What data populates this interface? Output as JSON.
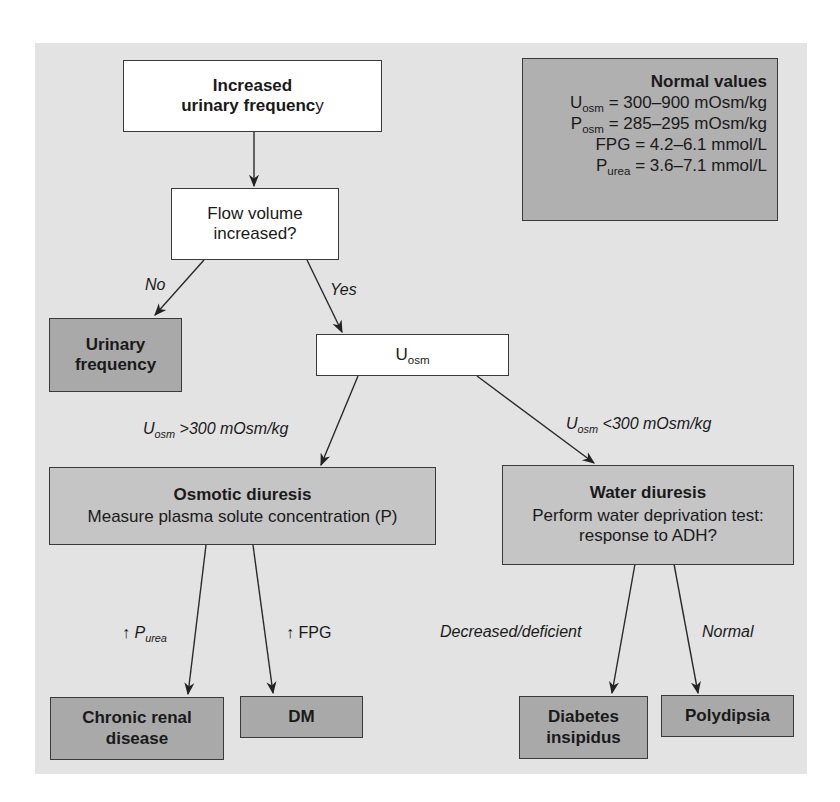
{
  "figure": {
    "normal_values": {
      "title": "Normal values",
      "rows": [
        {
          "symbol": "U",
          "sub": "osm",
          "value": " = 300–900 mOsm/kg"
        },
        {
          "symbol": "P",
          "sub": "osm",
          "value": " = 285–295 mOsm/kg"
        },
        {
          "symbol": "FPG",
          "sub": "",
          "value": " = 4.2–6.1 mmol/L"
        },
        {
          "symbol": "P",
          "sub": "urea",
          "value": " = 3.6–7.1 mmol/L"
        }
      ]
    },
    "nodes": {
      "start": {
        "line1": "Increased",
        "line2": "urinary frequenc",
        "line2_tail": "y"
      },
      "flow": {
        "line1": "Flow volume",
        "line2": "increased?"
      },
      "urinary_frequency": {
        "line1": "Urinary",
        "line2": "frequency"
      },
      "uosm": {
        "symbol": "U",
        "sub": "osm"
      },
      "osmotic": {
        "title": "Osmotic diuresis",
        "text": "Measure plasma solute concentration (P)"
      },
      "water": {
        "title": "Water diuresis",
        "text1": "Perform water deprivation test:",
        "text2": "response to ADH?"
      },
      "crd": {
        "line1": "Chronic renal",
        "line2": "disease"
      },
      "dm": {
        "label": "DM"
      },
      "di": {
        "line1": "Diabetes",
        "line2": "insipidus"
      },
      "polydipsia": {
        "label": "Polydipsia"
      }
    },
    "edge_labels": {
      "no": "No",
      "yes": "Yes",
      "uosm_high": {
        "symbol": "U",
        "sub": "osm",
        "text": " >300 mOsm/kg"
      },
      "uosm_low": {
        "symbol": "U",
        "sub": "osm",
        "text": " <300 mOsm/kg"
      },
      "purea": {
        "arrow": "↑ ",
        "symbol": "P",
        "sub": "urea"
      },
      "fpg": {
        "arrow": "↑ ",
        "text": "FPG"
      },
      "decreased": "Decreased/deficient",
      "normal": "Normal"
    },
    "colors": {
      "panel": "#e3e3e3",
      "white_box": "#ffffff",
      "mid_box": "#c5c5c5",
      "terminal_box": "#a9a9a9",
      "stroke": "#3a3a3a"
    }
  }
}
